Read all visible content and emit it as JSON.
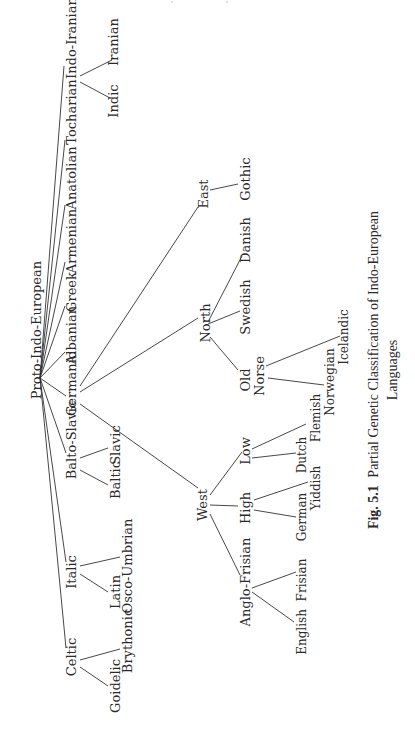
{
  "figure": {
    "orientation": "rotated-90-ccw",
    "caption_number": "Fig. 5.1",
    "caption_text": "Partial Genetic Classification of Indo-European",
    "caption_line2": "Languages"
  },
  "tree": {
    "root": "Proto-Indo-European",
    "branches": {
      "celtic": {
        "label": "Celtic",
        "children": [
          "Goidelic",
          "Brythonic"
        ]
      },
      "italic": {
        "label": "Italic",
        "children": [
          "Latin",
          "Osco-Umbrian"
        ]
      },
      "balto_slavic": {
        "label": "Balto-Slavic",
        "children": [
          "Baltic",
          "Slavic"
        ]
      },
      "germanic": {
        "label": "Germanic",
        "west": {
          "label": "West",
          "anglo_frisian": {
            "label": "Anglo-Frisian",
            "children": [
              "English",
              "Frisian"
            ]
          },
          "high": {
            "label": "High",
            "children": [
              "German",
              "Yiddish"
            ]
          },
          "low": {
            "label": "Low",
            "children": [
              "Dutch",
              "Flemish"
            ]
          }
        },
        "north": {
          "label": "North",
          "old_norse": {
            "label_1": "Old",
            "label_2": "Norse",
            "children": [
              "Norwegian",
              "Icelandic"
            ]
          },
          "others": [
            "Swedish",
            "Danish"
          ]
        },
        "east": {
          "label": "East",
          "children": [
            "Gothic"
          ]
        }
      },
      "albanian": {
        "label": "Albanian"
      },
      "greek": {
        "label": "Greek"
      },
      "armenian": {
        "label": "Armenian"
      },
      "anatolian": {
        "label": "Anatolian"
      },
      "tocharian": {
        "label": "Tocharian"
      },
      "indo_iranian": {
        "label": "Indo-Iranian",
        "children": [
          "Indic",
          "Iranian"
        ]
      }
    }
  }
}
